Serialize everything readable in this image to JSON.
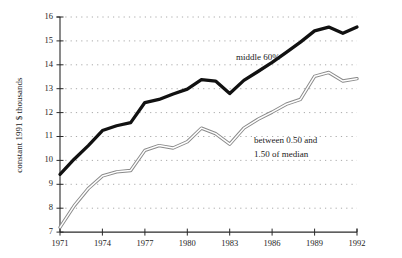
{
  "chart_data": {
    "type": "line",
    "title": "",
    "xlabel": "",
    "ylabel": "constant 1991 $ thousands",
    "xlim": [
      1971,
      1992
    ],
    "ylim": [
      7,
      16
    ],
    "grid": true,
    "grid_style": "dotted-horizontal",
    "legend": "inline-annotations",
    "x_ticks": [
      "1971",
      "1974",
      "1977",
      "1980",
      "1983",
      "1986",
      "1989",
      "1992"
    ],
    "y_ticks": [
      "7",
      "8",
      "9",
      "10",
      "11",
      "12",
      "13",
      "14",
      "15",
      "16"
    ],
    "x": [
      1971,
      1972,
      1973,
      1974,
      1975,
      1976,
      1977,
      1978,
      1979,
      1980,
      1981,
      1982,
      1983,
      1984,
      1985,
      1986,
      1987,
      1988,
      1989,
      1990,
      1991,
      1992
    ],
    "series": [
      {
        "name": "middle 60%",
        "color": "#111111",
        "style": "thick-solid",
        "values": [
          9.42,
          10.05,
          10.62,
          11.25,
          11.45,
          11.58,
          12.42,
          12.55,
          12.78,
          12.98,
          13.38,
          13.32,
          12.8,
          13.35,
          13.72,
          14.1,
          14.52,
          14.95,
          15.42,
          15.58,
          15.32,
          15.58
        ]
      },
      {
        "name": "between 0.50 and 1.50 of median",
        "color": "#8a8a8a",
        "style": "double-stroke-outline",
        "values": [
          7.2,
          8.1,
          8.82,
          9.35,
          9.52,
          9.58,
          10.42,
          10.62,
          10.52,
          10.78,
          11.35,
          11.12,
          10.68,
          11.35,
          11.72,
          12.02,
          12.35,
          12.55,
          13.52,
          13.68,
          13.32,
          13.42
        ]
      }
    ],
    "annotations": [
      {
        "name": "middle-60-label",
        "text": "middle 60%",
        "x_px": 236,
        "y_px": 60
      },
      {
        "name": "between-median-label-line1",
        "text": "between 0.50 and",
        "x_px": 254,
        "y_px": 143
      },
      {
        "name": "between-median-label-line2",
        "text": "1.50 of median",
        "x_px": 254,
        "y_px": 157
      }
    ]
  }
}
